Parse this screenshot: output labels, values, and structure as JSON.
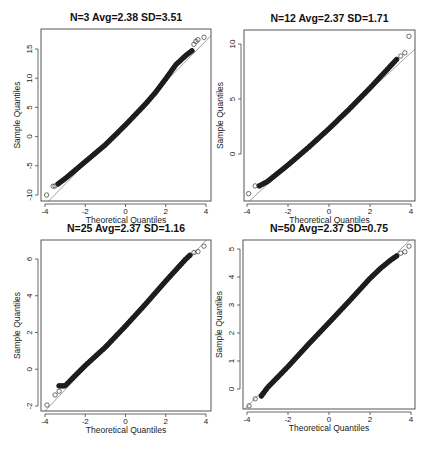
{
  "figure": {
    "width": 436,
    "height": 451
  },
  "chart_data": [
    {
      "type": "scatter",
      "subtype": "qq-plot",
      "title": "N=3 Avg=2.38 SD=3.51",
      "xlabel": "Theoretical Quantiles",
      "ylabel": "Sample Quantiles",
      "xlim": [
        -4,
        4
      ],
      "ylim": [
        -10.5,
        17.5
      ],
      "xticks": [
        -4,
        -2,
        0,
        2,
        4
      ],
      "yticks": [
        -10,
        -5,
        0,
        5,
        10,
        15
      ],
      "reference_line": {
        "intercept": 2.38,
        "slope": 3.51
      },
      "box": {
        "x0": 41,
        "y0": 29,
        "x1": 211,
        "y1": 201
      },
      "axis_px": {
        "x_at_-4": 45,
        "x_at_4": 206,
        "y_at_ymin_tick": 195,
        "y_at_ymax_tick": 49
      },
      "curve": [
        [
          -3.35,
          -8.1
        ],
        [
          -3.0,
          -7.2
        ],
        [
          -2.0,
          -4.3
        ],
        [
          -1.0,
          -1.4
        ],
        [
          0.0,
          2.0
        ],
        [
          1.0,
          5.6
        ],
        [
          1.5,
          7.6
        ],
        [
          2.0,
          9.9
        ],
        [
          2.5,
          12.3
        ],
        [
          3.0,
          13.9
        ],
        [
          3.3,
          14.7
        ]
      ],
      "outliers": [
        [
          -3.92,
          -10.0
        ],
        [
          -3.6,
          -8.5
        ],
        [
          -3.5,
          -8.45
        ],
        [
          3.4,
          15.8
        ],
        [
          3.5,
          16.3
        ],
        [
          3.6,
          16.6
        ],
        [
          3.9,
          17.0
        ]
      ],
      "grid": false,
      "legend": null
    },
    {
      "type": "scatter",
      "subtype": "qq-plot",
      "title": "N=12 Avg=2.37 SD=1.71",
      "xlabel": "Theoretical Quantiles",
      "ylabel": "Sample Quantiles",
      "xlim": [
        -4,
        4
      ],
      "ylim": [
        -4.3,
        11.3
      ],
      "xticks": [
        -4,
        -2,
        0,
        2,
        4
      ],
      "yticks": [
        0,
        5,
        10
      ],
      "reference_line": {
        "intercept": 2.37,
        "slope": 1.71
      },
      "box": {
        "x0": 244,
        "y0": 30,
        "x1": 415,
        "y1": 201
      },
      "axis_px": {
        "x_at_-4": 247,
        "x_at_4": 411,
        "y_at_ymin_tick": 154,
        "y_at_ymax_tick": 44
      },
      "curve": [
        [
          -3.4,
          -2.9
        ],
        [
          -3.0,
          -2.5
        ],
        [
          -2.0,
          -1.0
        ],
        [
          -1.0,
          0.6
        ],
        [
          0.0,
          2.3
        ],
        [
          1.0,
          4.1
        ],
        [
          2.0,
          6.0
        ],
        [
          2.5,
          7.0
        ],
        [
          3.0,
          8.0
        ],
        [
          3.3,
          8.6
        ]
      ],
      "outliers": [
        [
          -3.92,
          -3.6
        ],
        [
          -3.6,
          -2.9
        ],
        [
          3.5,
          8.9
        ],
        [
          3.7,
          9.2
        ],
        [
          3.9,
          10.7
        ]
      ],
      "grid": false,
      "legend": null
    },
    {
      "type": "scatter",
      "subtype": "qq-plot",
      "title": "N=25 Avg=2.37 SD=1.16",
      "xlabel": "Theoretical Quantiles",
      "ylabel": "Sample Quantiles",
      "xlim": [
        -4,
        4
      ],
      "ylim": [
        -2.2,
        7.0
      ],
      "xticks": [
        -4,
        -2,
        0,
        2,
        4
      ],
      "yticks": [
        -2,
        0,
        2,
        4,
        6
      ],
      "reference_line": {
        "intercept": 2.37,
        "slope": 1.16
      },
      "box": {
        "x0": 41,
        "y0": 240,
        "x1": 211,
        "y1": 411
      },
      "axis_px": {
        "x_at_-4": 45,
        "x_at_4": 206,
        "y_at_ymin_tick": 406,
        "y_at_ymax_tick": 259
      },
      "curve": [
        [
          -3.3,
          -0.9
        ],
        [
          -3.0,
          -0.9
        ],
        [
          -2.0,
          0.2
        ],
        [
          -1.0,
          1.2
        ],
        [
          0.0,
          2.35
        ],
        [
          1.0,
          3.55
        ],
        [
          2.0,
          4.8
        ],
        [
          2.5,
          5.4
        ],
        [
          3.0,
          6.0
        ],
        [
          3.2,
          6.2
        ]
      ],
      "outliers": [
        [
          -3.9,
          -1.95
        ],
        [
          -3.5,
          -1.4
        ],
        [
          -3.3,
          -1.2
        ],
        [
          3.4,
          6.35
        ],
        [
          3.6,
          6.4
        ],
        [
          3.9,
          6.7
        ]
      ],
      "grid": false,
      "legend": null
    },
    {
      "type": "scatter",
      "subtype": "qq-plot",
      "title": "N=50 Avg=2.37 SD=0.75",
      "xlabel": "Theoretical Quantiles",
      "ylabel": "Sample Quantiles",
      "xlim": [
        -4,
        4
      ],
      "ylim": [
        -0.75,
        5.35
      ],
      "xticks": [
        -4,
        -2,
        0,
        2,
        4
      ],
      "yticks": [
        0,
        1,
        2,
        3,
        4,
        5
      ],
      "reference_line": {
        "intercept": 2.37,
        "slope": 0.75
      },
      "box": {
        "x0": 243,
        "y0": 240,
        "x1": 415,
        "y1": 409
      },
      "axis_px": {
        "x_at_-4": 247,
        "x_at_4": 411,
        "y_at_ymin_tick": 389,
        "y_at_ymax_tick": 249
      },
      "curve": [
        [
          -3.3,
          -0.25
        ],
        [
          -3.0,
          0.05
        ],
        [
          -2.0,
          0.8
        ],
        [
          -1.0,
          1.6
        ],
        [
          0.0,
          2.37
        ],
        [
          1.0,
          3.15
        ],
        [
          2.0,
          3.95
        ],
        [
          2.5,
          4.3
        ],
        [
          3.0,
          4.6
        ],
        [
          3.3,
          4.75
        ]
      ],
      "outliers": [
        [
          -3.9,
          -0.6
        ],
        [
          -3.6,
          -0.35
        ],
        [
          3.5,
          4.85
        ],
        [
          3.7,
          4.9
        ],
        [
          3.9,
          5.1
        ]
      ],
      "grid": false,
      "legend": null
    }
  ]
}
